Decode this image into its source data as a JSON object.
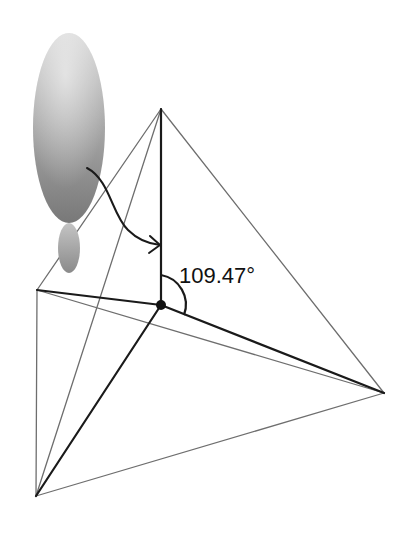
{
  "diagram": {
    "angle_label": "109.47°",
    "vertices": {
      "center": {
        "x": 161,
        "y": 305
      },
      "top": {
        "x": 161,
        "y": 109
      },
      "left": {
        "x": 37,
        "y": 290
      },
      "right": {
        "x": 384,
        "y": 393
      },
      "bottom": {
        "x": 36,
        "y": 496
      }
    },
    "bonds": [
      "center-top",
      "center-left",
      "center-right",
      "center-bottom"
    ],
    "edges": [
      "top-left",
      "top-right",
      "top-bottom",
      "left-right",
      "left-bottom",
      "right-bottom"
    ],
    "orbital": {
      "large_lobe": {
        "cx": 69,
        "cy": 128,
        "rx": 36,
        "ry": 95
      },
      "small_lobe": {
        "cx": 69,
        "cy": 248,
        "rx": 11,
        "ry": 25
      }
    },
    "colors": {
      "edge": "#6e6e6e",
      "bond": "#1a1a1a",
      "orbital_light": "#d8d8d8",
      "orbital_dark": "#7c7c7c"
    }
  }
}
